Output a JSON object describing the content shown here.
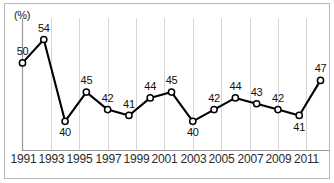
{
  "chart_data": {
    "type": "line",
    "title": "",
    "subtitle": "",
    "xlabel": "",
    "ylabel": "",
    "unit_label": "(%)",
    "grid": true,
    "legend": "none",
    "xlim": [
      1991,
      2012
    ],
    "ylim": [
      35,
      57
    ],
    "x_tick_labels": [
      "1991",
      "1993",
      "1995",
      "1997",
      "1999",
      "2001",
      "2003",
      "2005",
      "2007",
      "2009",
      "2011"
    ],
    "x": [
      1991,
      1992.5,
      1994,
      1995.5,
      1997,
      1998.5,
      2000,
      2001.5,
      2003,
      2004.5,
      2006,
      2007.5,
      2009,
      2010.5,
      2012
    ],
    "values": [
      50,
      54,
      40,
      45,
      42,
      41,
      44,
      45,
      40,
      42,
      44,
      43,
      42,
      41,
      47
    ],
    "point_labels": [
      "50",
      "54",
      "40",
      "45",
      "42",
      "41",
      "44",
      "45",
      "40",
      "42",
      "44",
      "43",
      "42",
      "41",
      "47"
    ],
    "label_positions": [
      "above",
      "above",
      "below",
      "above",
      "above",
      "above",
      "above",
      "above",
      "below",
      "above",
      "above",
      "above",
      "above",
      "below",
      "above"
    ],
    "series": [
      {
        "name": "",
        "values": [
          50,
          54,
          40,
          45,
          42,
          41,
          44,
          45,
          40,
          42,
          44,
          43,
          42,
          41,
          47
        ]
      }
    ],
    "colors": {
      "line": "#000000",
      "marker_fill": "#ffffff",
      "marker_stroke": "#000000",
      "grid": "#d6d6d6",
      "axis": "#9a9a9a",
      "border": "#b9b9b9",
      "text": "#1a1a1a"
    }
  }
}
